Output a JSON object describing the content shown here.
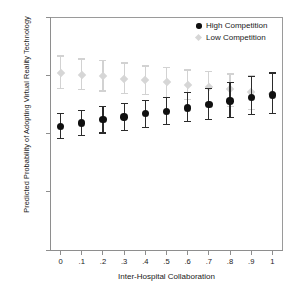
{
  "chart_data": {
    "type": "scatter",
    "title": "",
    "xlabel": "Inter-Hospital Collaboration",
    "ylabel": "Predicted Probability of Adopting Virtual Reality Technology",
    "x": [
      0,
      0.1,
      0.2,
      0.3,
      0.4,
      0.5,
      0.6,
      0.7,
      0.8,
      0.9,
      1
    ],
    "xtick_labels": [
      "0",
      ".1",
      ".2",
      ".3",
      ".4",
      ".5",
      ".6",
      ".7",
      ".8",
      ".9",
      "1"
    ],
    "ytick_labels": [
      "0",
      ".05",
      ".1",
      ".15",
      ".2"
    ],
    "ytick_values": [
      0,
      0.05,
      0.1,
      0.15,
      0.2
    ],
    "xlim": [
      -0.05,
      1.05
    ],
    "ylim": [
      0,
      0.2
    ],
    "grid": false,
    "legend_position": "top-right",
    "series": [
      {
        "name": "High Competition",
        "marker": "circle",
        "color": "#101010",
        "values": [
          0.106,
          0.109,
          0.112,
          0.114,
          0.117,
          0.119,
          0.122,
          0.125,
          0.128,
          0.131,
          0.133
        ],
        "ci_lower": [
          0.0955,
          0.0985,
          0.1005,
          0.1025,
          0.105,
          0.1075,
          0.11,
          0.112,
          0.114,
          0.116,
          0.1175
        ],
        "ci_upper": [
          0.117,
          0.1195,
          0.123,
          0.1255,
          0.128,
          0.131,
          0.1355,
          0.1385,
          0.1435,
          0.149,
          0.152
        ]
      },
      {
        "name": "Low Competition",
        "marker": "diamond",
        "color": "#d6d6d6",
        "values": [
          0.152,
          0.15,
          0.149,
          0.147,
          0.146,
          0.144,
          0.142,
          0.14,
          0.138,
          0.136,
          0.134
        ],
        "ci_lower": [
          0.1385,
          0.1375,
          0.1365,
          0.1345,
          0.1335,
          0.131,
          0.129,
          0.1265,
          0.1235,
          0.1205,
          0.1175
        ],
        "ci_upper": [
          0.1665,
          0.164,
          0.1625,
          0.1605,
          0.158,
          0.1565,
          0.1545,
          0.153,
          0.151,
          0.1495,
          0.152
        ]
      }
    ]
  },
  "legend": {
    "items": [
      {
        "label": "High Competition",
        "marker": "circle-icon"
      },
      {
        "label": "Low Competition",
        "marker": "diamond-icon"
      }
    ]
  },
  "caption": ""
}
